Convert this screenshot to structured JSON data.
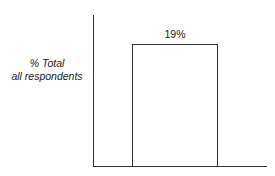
{
  "chart_data": {
    "type": "bar",
    "title": "",
    "xlabel": "",
    "ylabel": "% Total all respondents",
    "ylabel_lines": [
      "% Total",
      "all respondents"
    ],
    "categories": [
      ""
    ],
    "values": [
      19
    ],
    "data_labels": [
      "19%"
    ],
    "grid": false,
    "legend": null,
    "bar_fill": "#ffffff",
    "bar_edge": "#333333"
  }
}
